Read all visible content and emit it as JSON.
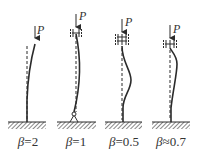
{
  "figure": {
    "load_symbol": "P",
    "columns": [
      {
        "id": "fixed-free",
        "beta_symbol": "β",
        "relation": "=",
        "value": "2",
        "label": "β=2"
      },
      {
        "id": "pinned-fixed",
        "beta_symbol": "β",
        "relation": "=",
        "value": "1",
        "label": "β=1"
      },
      {
        "id": "fixed-fixed",
        "beta_symbol": "β",
        "relation": "=",
        "value": "0.5",
        "label": "β=0.5"
      },
      {
        "id": "fixed-pinned",
        "beta_symbol": "β",
        "relation": "≈",
        "value": "0.7",
        "label": "β≈0.7"
      }
    ]
  },
  "colors": {
    "line": "#2b2b2b",
    "hatch": "#555555",
    "background": "#ffffff"
  }
}
